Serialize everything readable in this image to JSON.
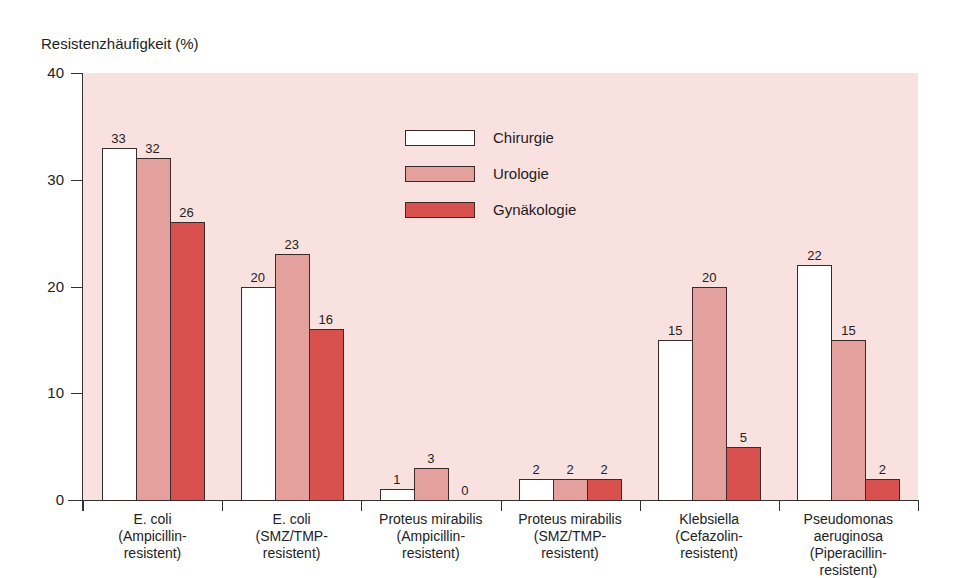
{
  "chart_data": {
    "type": "bar",
    "title": "",
    "xlabel": "",
    "ylabel": "Resistenzhäufigkeit (%)",
    "ylim": [
      0,
      40
    ],
    "yticks": [
      "0",
      "10",
      "20",
      "30",
      "40"
    ],
    "grid": false,
    "legend_position": "upper-center-inside",
    "categories": [
      "E. coli (Ampicillin-resistent)",
      "E. coli (SMZ/TMP-resistent)",
      "Proteus mirabilis (Ampicillin-resistent)",
      "Proteus mirabilis (SMZ/TMP-resistent)",
      "Klebsiella (Cefazolin-resistent)",
      "Pseudomonas aeruginosa (Piperacillin-resistent)"
    ],
    "category_lines": [
      [
        "E. coli",
        "(Ampicillin-",
        "resistent)"
      ],
      [
        "E. coli",
        "(SMZ/TMP-",
        "resistent)"
      ],
      [
        "Proteus mirabilis",
        "(Ampicillin-",
        "resistent)"
      ],
      [
        "Proteus mirabilis",
        "(SMZ/TMP-",
        "resistent)"
      ],
      [
        "Klebsiella",
        "(Cefazolin-",
        "resistent)"
      ],
      [
        "Pseudomonas",
        "aeruginosa",
        "(Piperacillin-",
        "resistent)"
      ]
    ],
    "series": [
      {
        "name": "Chirurgie",
        "color": "#ffffff",
        "values": [
          33,
          20,
          1,
          2,
          15,
          22
        ]
      },
      {
        "name": "Urologie",
        "color": "#e3a09c",
        "values": [
          32,
          23,
          3,
          2,
          20,
          15
        ]
      },
      {
        "name": "Gynäkologie",
        "color": "#d9514e",
        "values": [
          26,
          16,
          0,
          2,
          5,
          2
        ]
      }
    ],
    "background_color": "#f9e1df"
  }
}
